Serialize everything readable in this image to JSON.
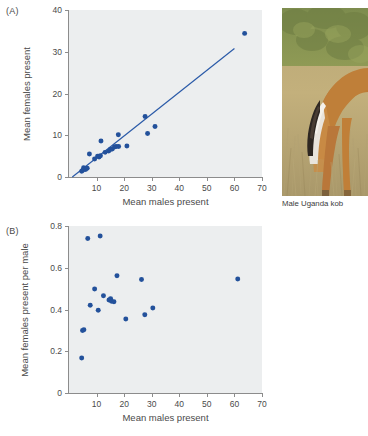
{
  "figure": {
    "photo_caption": "Male Uganda kob",
    "photo_alt": "male-uganda-kob-photo",
    "marker_color": "#23519b",
    "line_color": "#2a5aa8",
    "plot_bg": "#eceeef",
    "axis_color": "#8c8c8c"
  },
  "panels": {
    "a": {
      "label": "(A)"
    },
    "b": {
      "label": "(B)"
    }
  },
  "chart_data": [
    {
      "panel": "(A)",
      "type": "scatter",
      "title": "",
      "xlabel": "Mean males present",
      "ylabel": "Mean females present",
      "xlim": [
        0,
        70
      ],
      "ylim": [
        0,
        40
      ],
      "xticks": [
        10,
        20,
        30,
        40,
        50,
        60,
        70
      ],
      "yticks": [
        0,
        10,
        20,
        30,
        40
      ],
      "grid": false,
      "legend": "none",
      "points": [
        {
          "x": 4.6,
          "y": 1.4
        },
        {
          "x": 5.0,
          "y": 1.6
        },
        {
          "x": 5.3,
          "y": 2.2
        },
        {
          "x": 6.0,
          "y": 1.8
        },
        {
          "x": 6.6,
          "y": 2.1
        },
        {
          "x": 7.4,
          "y": 5.5
        },
        {
          "x": 9.3,
          "y": 4.3
        },
        {
          "x": 10.4,
          "y": 5.0
        },
        {
          "x": 10.9,
          "y": 4.8
        },
        {
          "x": 11.4,
          "y": 5.1
        },
        {
          "x": 11.6,
          "y": 8.6
        },
        {
          "x": 13.1,
          "y": 5.9
        },
        {
          "x": 14.4,
          "y": 6.2
        },
        {
          "x": 15.0,
          "y": 6.6
        },
        {
          "x": 15.7,
          "y": 6.7
        },
        {
          "x": 16.5,
          "y": 7.2
        },
        {
          "x": 17.1,
          "y": 7.3
        },
        {
          "x": 17.9,
          "y": 10.1
        },
        {
          "x": 18.0,
          "y": 7.3
        },
        {
          "x": 21.0,
          "y": 7.4
        },
        {
          "x": 27.6,
          "y": 14.5
        },
        {
          "x": 28.5,
          "y": 10.4
        },
        {
          "x": 31.2,
          "y": 12.1
        },
        {
          "x": 63.7,
          "y": 34.4
        }
      ],
      "fit_line": {
        "x0": 1.2,
        "y0": 0.0,
        "x1": 60.0,
        "y1": 30.8
      }
    },
    {
      "panel": "(B)",
      "type": "scatter",
      "title": "",
      "xlabel": "Mean males present",
      "ylabel": "Mean females present per male",
      "xlim": [
        0,
        70
      ],
      "ylim": [
        0,
        0.8
      ],
      "xticks": [
        10,
        20,
        30,
        40,
        50,
        60,
        70
      ],
      "yticks": [
        0,
        0.2,
        0.4,
        0.6,
        0.8
      ],
      "grid": false,
      "legend": "none",
      "points": [
        {
          "x": 4.6,
          "y": 0.168
        },
        {
          "x": 4.9,
          "y": 0.299
        },
        {
          "x": 5.4,
          "y": 0.303
        },
        {
          "x": 6.8,
          "y": 0.74
        },
        {
          "x": 7.7,
          "y": 0.42
        },
        {
          "x": 9.3,
          "y": 0.498
        },
        {
          "x": 10.6,
          "y": 0.396
        },
        {
          "x": 11.3,
          "y": 0.752
        },
        {
          "x": 12.5,
          "y": 0.466
        },
        {
          "x": 14.5,
          "y": 0.445
        },
        {
          "x": 15.1,
          "y": 0.452
        },
        {
          "x": 15.4,
          "y": 0.44
        },
        {
          "x": 16.3,
          "y": 0.437
        },
        {
          "x": 17.4,
          "y": 0.562
        },
        {
          "x": 20.6,
          "y": 0.354
        },
        {
          "x": 26.3,
          "y": 0.544
        },
        {
          "x": 27.5,
          "y": 0.375
        },
        {
          "x": 30.4,
          "y": 0.407
        },
        {
          "x": 61.2,
          "y": 0.546
        }
      ]
    }
  ]
}
